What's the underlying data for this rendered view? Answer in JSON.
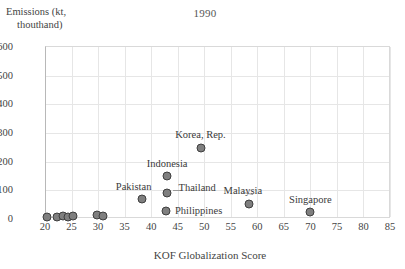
{
  "chart_data": {
    "type": "scatter",
    "title": "1990",
    "xlabel": "KOF Globalization Score",
    "ylabel_line1": "Emissions (kt,",
    "ylabel_line2": "thouthand)",
    "xlim": [
      20,
      85
    ],
    "ylim": [
      0,
      600
    ],
    "xticks": [
      20,
      25,
      30,
      35,
      40,
      45,
      50,
      55,
      60,
      65,
      70,
      75,
      80,
      85
    ],
    "yticks": [
      0,
      100,
      200,
      300,
      400,
      500,
      600
    ],
    "grid": true,
    "legend": "none",
    "marker_color": "#7f7f7f",
    "marker_edge_color": "#3f3f3f",
    "points": [
      {
        "label": "",
        "x": 20.4,
        "y": 5
      },
      {
        "label": "",
        "x": 22.3,
        "y": 5
      },
      {
        "label": "",
        "x": 23.4,
        "y": 6
      },
      {
        "label": "",
        "x": 24.3,
        "y": 5
      },
      {
        "label": "",
        "x": 25.2,
        "y": 6
      },
      {
        "label": "",
        "x": 29.8,
        "y": 12
      },
      {
        "label": "",
        "x": 30.9,
        "y": 8
      },
      {
        "label": "Pakistan",
        "x": 38.2,
        "y": 68
      },
      {
        "label": "Philippines",
        "x": 42.8,
        "y": 26
      },
      {
        "label": "Thailand",
        "x": 42.9,
        "y": 86
      },
      {
        "label": "Indonesia",
        "x": 43.0,
        "y": 148
      },
      {
        "label": "Korea, Rep.",
        "x": 49.3,
        "y": 245
      },
      {
        "label": "Malaysia",
        "x": 58.4,
        "y": 50
      },
      {
        "label": "Singapore",
        "x": 70.0,
        "y": 22
      }
    ],
    "annotations": [
      {
        "text": "Korea, Rep.",
        "anchor": "above"
      },
      {
        "text": "Indonesia",
        "anchor": "above"
      },
      {
        "text": "Thailand",
        "anchor": "right"
      },
      {
        "text": "Pakistan",
        "anchor": "above-left"
      },
      {
        "text": "Philippines",
        "anchor": "right"
      },
      {
        "text": "Malaysia",
        "anchor": "above-left"
      },
      {
        "text": "Singapore",
        "anchor": "above"
      }
    ]
  },
  "labels": {
    "korea": "Korea, Rep.",
    "indonesia": "Indonesia",
    "thailand": "Thailand",
    "pakistan": "Pakistan",
    "philippines": "Philippines",
    "malaysia": "Malaysia",
    "singapore": "Singapore"
  }
}
